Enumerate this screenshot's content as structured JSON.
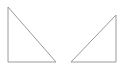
{
  "canvas": {
    "width": 121,
    "height": 69,
    "background": "#ffffff"
  },
  "style": {
    "stroke": "#9a9a9a",
    "stroke_width": 1,
    "fill": "none"
  },
  "shapes": [
    {
      "name": "left-right-triangle",
      "type": "triangle",
      "points": [
        [
          8,
          7
        ],
        [
          8,
          62
        ],
        [
          56,
          62
        ]
      ]
    },
    {
      "name": "right-right-triangle",
      "type": "triangle",
      "points": [
        [
          116,
          15
        ],
        [
          116,
          62
        ],
        [
          71,
          62
        ]
      ]
    }
  ]
}
